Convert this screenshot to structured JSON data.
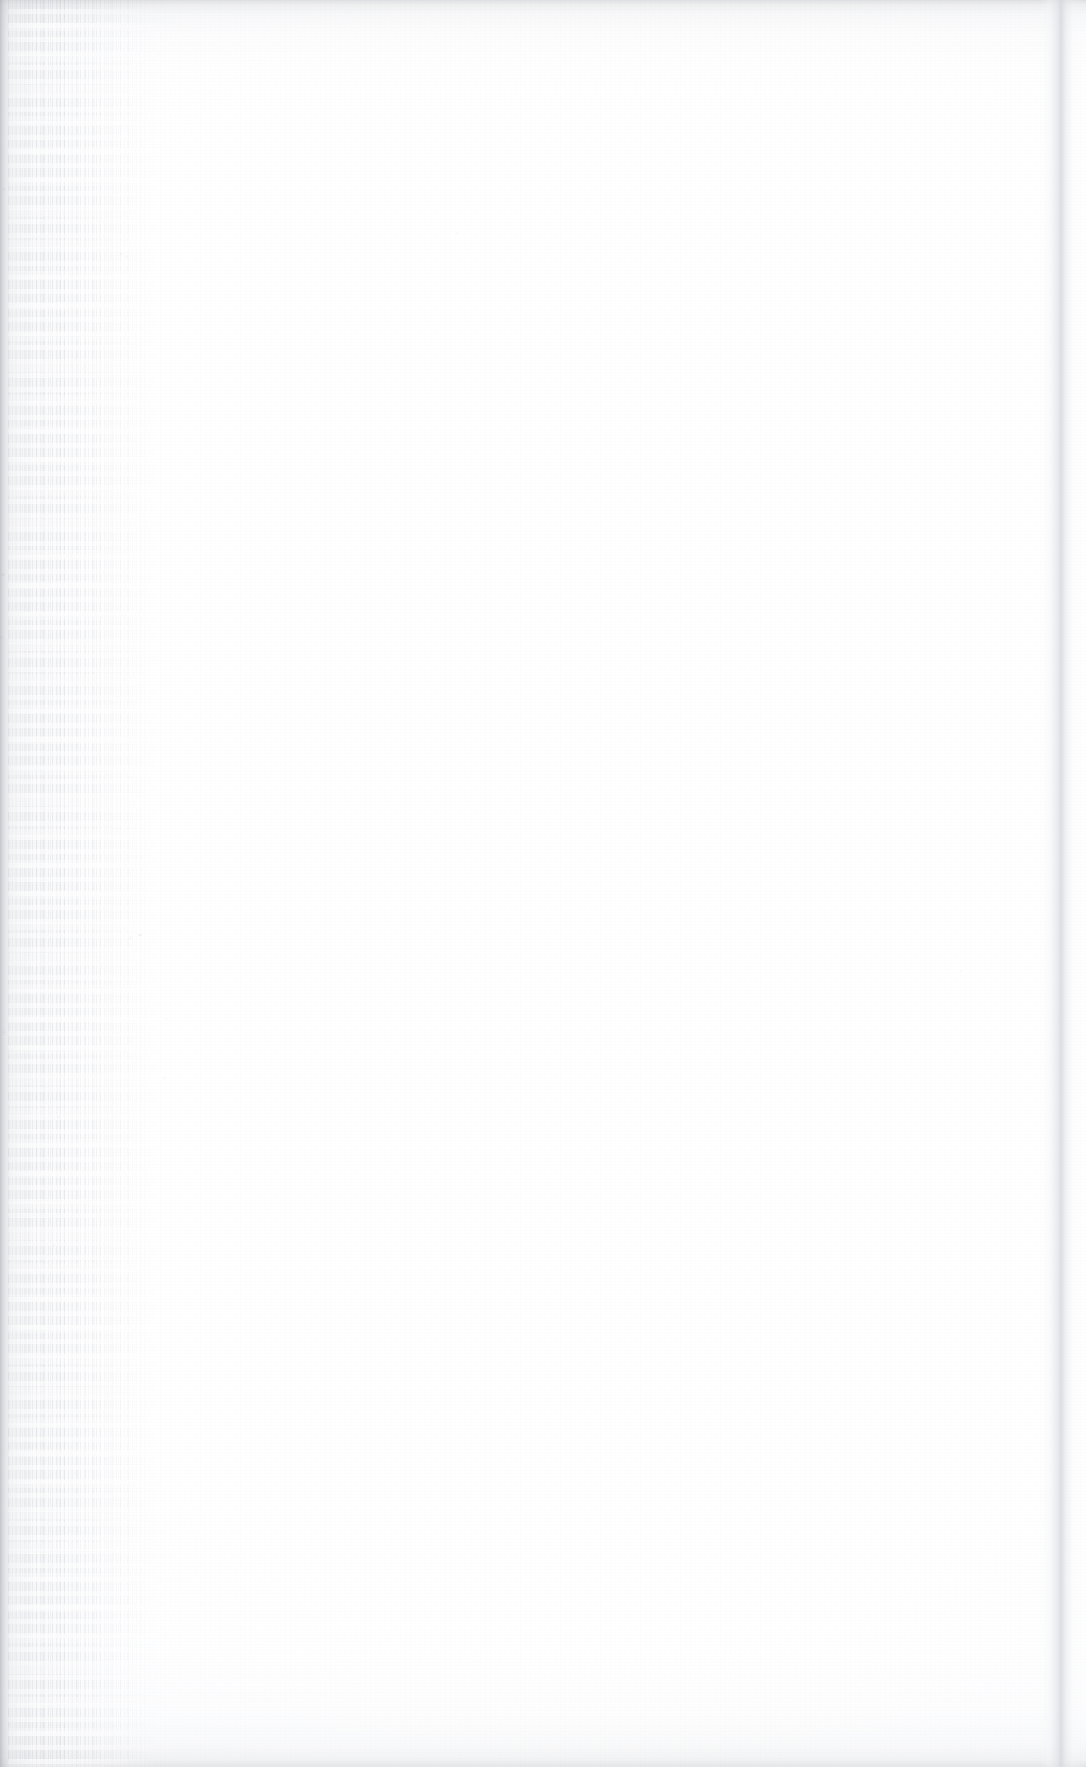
{
  "page": {
    "kind": "blank-scanned-book-page",
    "width": 1086,
    "height": 1767,
    "printed_text": "",
    "headline": "",
    "body_text": "",
    "page_number": "",
    "header": "",
    "footer": "",
    "caption": "",
    "note": ""
  },
  "colors": {
    "paper": "#ffffff",
    "paper_shade": "#fdfdfe",
    "edge_gray": "#d5d7dd",
    "gutter_gray": "#c4c6cd",
    "streak_gray": "#a0a2aa",
    "speck_gray": "#9698a0"
  },
  "artifacts": {
    "top_edge": "top-edge-shadow",
    "bottom_edge": "bottom-edge-shadow",
    "right_edge": "right-page-edge-band",
    "left_edge": "binding-gutter-edge",
    "gutter_shadow": "binding-gutter-shadow",
    "gutter_streaks": "vertical-scan-streaks",
    "grain": "paper-grain-texture"
  },
  "specks": [
    {
      "x": 138,
      "y": 934,
      "w": 4,
      "h": 2,
      "o": 0.34
    },
    {
      "x": 129,
      "y": 937,
      "w": 3,
      "h": 2,
      "o": 0.26
    },
    {
      "x": 120,
      "y": 253,
      "w": 3,
      "h": 2,
      "o": 0.22
    },
    {
      "x": 126,
      "y": 256,
      "w": 2,
      "h": 2,
      "o": 0.18
    },
    {
      "x": 163,
      "y": 1077,
      "w": 3,
      "h": 2,
      "o": 0.2
    },
    {
      "x": 57,
      "y": 1116,
      "w": 3,
      "h": 2,
      "o": 0.22
    },
    {
      "x": 2,
      "y": 188,
      "w": 4,
      "h": 2,
      "o": 0.26
    },
    {
      "x": 1,
      "y": 573,
      "w": 4,
      "h": 3,
      "o": 0.28
    },
    {
      "x": 0,
      "y": 636,
      "w": 4,
      "h": 3,
      "o": 0.24
    },
    {
      "x": 3,
      "y": 1031,
      "w": 3,
      "h": 2,
      "o": 0.2
    },
    {
      "x": 52,
      "y": 1244,
      "w": 3,
      "h": 2,
      "o": 0.18
    },
    {
      "x": 166,
      "y": 1018,
      "w": 2,
      "h": 2,
      "o": 0.16
    },
    {
      "x": 960,
      "y": 970,
      "w": 3,
      "h": 2,
      "o": 0.16
    },
    {
      "x": 455,
      "y": 232,
      "w": 3,
      "h": 2,
      "o": 0.13
    },
    {
      "x": 135,
      "y": 856,
      "w": 2,
      "h": 2,
      "o": 0.17
    },
    {
      "x": 104,
      "y": 1458,
      "w": 3,
      "h": 2,
      "o": 0.17
    }
  ]
}
